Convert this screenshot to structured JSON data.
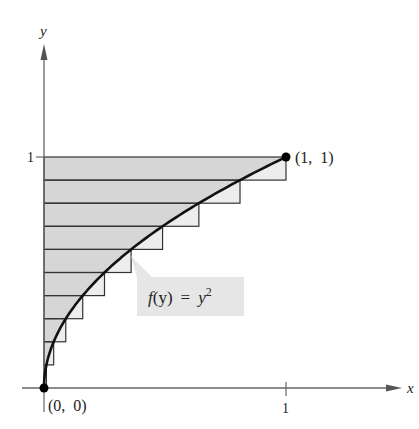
{
  "figure": {
    "function_label": {
      "f": "f",
      "arg": "(y)",
      "eq": "=",
      "base": "y",
      "exp": "2"
    },
    "axes": {
      "x_label": "x",
      "y_label": "y",
      "x_tick_label": "1",
      "y_tick_label": "1"
    },
    "points": [
      {
        "label": "(1,  1)",
        "x": 1,
        "y": 1
      },
      {
        "label": "(0,  0)",
        "x": 0,
        "y": 0
      }
    ],
    "rectangles": {
      "count": 10,
      "y_intervals": [
        [
          0,
          0.1
        ],
        [
          0.1,
          0.2
        ],
        [
          0.2,
          0.3
        ],
        [
          0.3,
          0.4
        ],
        [
          0.4,
          0.5
        ],
        [
          0.5,
          0.6
        ],
        [
          0.6,
          0.7
        ],
        [
          0.7,
          0.8
        ],
        [
          0.8,
          0.9
        ],
        [
          0.9,
          1.0
        ]
      ],
      "widths": [
        0.01,
        0.04,
        0.09,
        0.16,
        0.25,
        0.36,
        0.49,
        0.64,
        0.81,
        1.0
      ]
    },
    "colors": {
      "region_under_curve": "#d6d6d6",
      "rect_excess": "#ededed",
      "callout_bg": "#e6e6e6",
      "curve": "#111111",
      "axis": "#666666"
    }
  }
}
